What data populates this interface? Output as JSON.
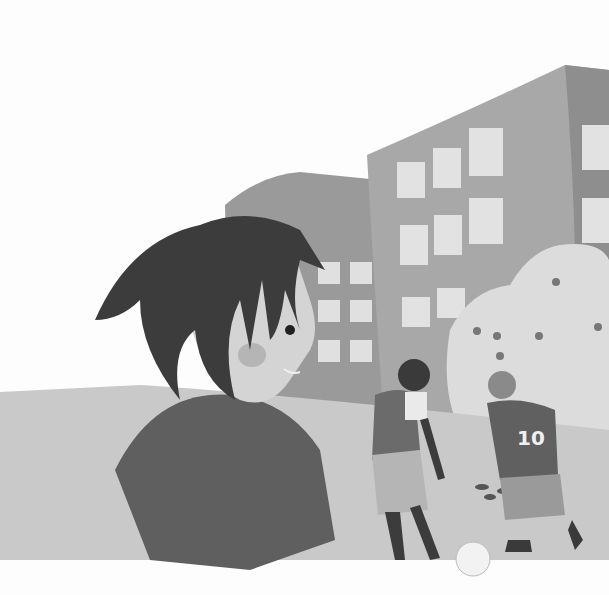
{
  "scene": {
    "description": "Grayscale vector illustration of children in a schoolyard: a boy in the foreground looking back over his shoulder, two boys playing soccer in the background, office/school buildings and a flowering tree behind them.",
    "jersey_number": "10",
    "colors": {
      "sky": "#fdfdfd",
      "building_main": "#a6a6a6",
      "building_dark": "#8f8f8f",
      "window": "#e2e2e2",
      "ground": "#c9c9c9",
      "hair": "#3c3c3c",
      "skin": "#d4d4d4",
      "shirt_fg": "#5f5f5f",
      "tree": "#dcdcdc",
      "ball": "#f2f2f2"
    }
  }
}
